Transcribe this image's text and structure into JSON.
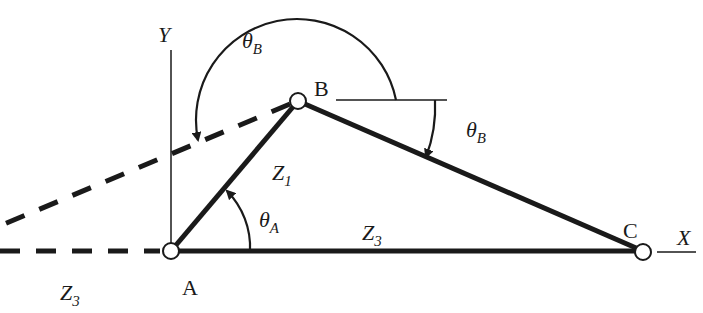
{
  "diagram": {
    "type": "four-bar / triangle vector loop",
    "axes": {
      "x_label": "X",
      "y_label": "Y"
    },
    "points": [
      {
        "id": "A",
        "label": "A"
      },
      {
        "id": "B",
        "label": "B"
      },
      {
        "id": "C",
        "label": "C"
      }
    ],
    "links": [
      {
        "id": "Z1",
        "base": "Z",
        "sub": "1",
        "from": "A",
        "to": "B"
      },
      {
        "id": "Z3",
        "base": "Z",
        "sub": "3",
        "from": "A",
        "to": "C"
      },
      {
        "id": "BC",
        "from": "B",
        "to": "C"
      }
    ],
    "angles": [
      {
        "id": "theta_A_label",
        "base": "θ",
        "sub": "A"
      },
      {
        "id": "theta_B_top_label",
        "base": "θ",
        "sub": "B"
      },
      {
        "id": "theta_B_right_label",
        "base": "θ",
        "sub": "B"
      }
    ],
    "extension_label": {
      "base": "Z",
      "sub": "3"
    },
    "colors": {
      "ink": "#1a1a1a",
      "background": "#ffffff"
    }
  }
}
